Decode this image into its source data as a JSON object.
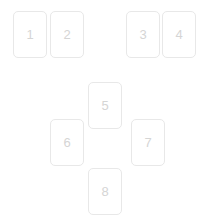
{
  "board": {
    "name": "card-board",
    "background_color": "#ffffff",
    "width": 208,
    "height": 222,
    "card_border_color": "#e8e8e8",
    "card_background_color": "#ffffff",
    "card_label_color": "#d5d5d5"
  },
  "cards": [
    {
      "label": "1",
      "x": 13,
      "y": 11,
      "w": 34,
      "h": 47,
      "group": "top-left"
    },
    {
      "label": "2",
      "x": 50,
      "y": 11,
      "w": 34,
      "h": 47,
      "group": "top-left"
    },
    {
      "label": "3",
      "x": 126,
      "y": 11,
      "w": 34,
      "h": 47,
      "group": "top-right"
    },
    {
      "label": "4",
      "x": 162,
      "y": 11,
      "w": 34,
      "h": 47,
      "group": "top-right"
    },
    {
      "label": "5",
      "x": 88,
      "y": 82,
      "w": 34,
      "h": 47,
      "group": "cross-top"
    },
    {
      "label": "6",
      "x": 50,
      "y": 119,
      "w": 34,
      "h": 47,
      "group": "cross-left"
    },
    {
      "label": "7",
      "x": 131,
      "y": 119,
      "w": 34,
      "h": 47,
      "group": "cross-right"
    },
    {
      "label": "8",
      "x": 88,
      "y": 168,
      "w": 34,
      "h": 47,
      "group": "cross-bottom"
    }
  ]
}
